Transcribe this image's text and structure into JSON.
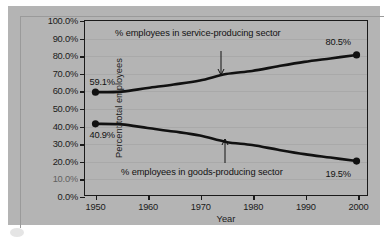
{
  "chart_data": {
    "type": "line",
    "title": "",
    "xlabel": "Year",
    "ylabel": "Percent total employees",
    "xlim": [
      1948,
      2002
    ],
    "ylim": [
      0,
      100
    ],
    "grid": true,
    "legend_position": "inline-annotations",
    "x_ticks": [
      "1950",
      "1960",
      "1970",
      "1980",
      "1990",
      "2000"
    ],
    "x_tick_values": [
      1950,
      1960,
      1970,
      1980,
      1990,
      2000
    ],
    "y_ticks": [
      "0.0%",
      "10.0%",
      "20.0%",
      "30.0%",
      "40.0%",
      "50.0%",
      "60.0%",
      "70.0%",
      "80.0%",
      "90.0%",
      "100.0%"
    ],
    "y_tick_values": [
      0,
      10,
      20,
      30,
      40,
      50,
      60,
      70,
      80,
      90,
      100
    ],
    "series": [
      {
        "name": "% employees in service-producing sector",
        "x": [
          1950,
          1955,
          1960,
          1965,
          1970,
          1975,
          1980,
          1985,
          1990,
          1995,
          2000
        ],
        "values": [
          59.1,
          59.4,
          61.5,
          63.5,
          65.8,
          69.5,
          71.3,
          74.0,
          76.5,
          78.5,
          80.5
        ],
        "start_label": "59.1%",
        "end_label": "80.5%"
      },
      {
        "name": "% employees in goods-producing sector",
        "x": [
          1950,
          1955,
          1960,
          1965,
          1970,
          1975,
          1980,
          1985,
          1990,
          1995,
          2000
        ],
        "values": [
          40.9,
          40.6,
          38.5,
          36.5,
          34.2,
          30.5,
          28.7,
          26.0,
          23.5,
          21.5,
          19.5
        ],
        "start_label": "40.9%",
        "end_label": "19.5%"
      }
    ],
    "annotations": [
      {
        "text": "% employees in service-producing sector",
        "points_to_series": "service",
        "arrow": "down"
      },
      {
        "text": "% employees in goods-producing sector",
        "points_to_series": "goods",
        "arrow": "up"
      }
    ],
    "point_labels": [
      {
        "text": "59.1%",
        "x": 1950,
        "y": 59.1,
        "position": "above-right"
      },
      {
        "text": "80.5%",
        "x": 2000,
        "y": 80.5,
        "position": "above-left"
      },
      {
        "text": "40.9%",
        "x": 1950,
        "y": 40.9,
        "position": "below-right"
      },
      {
        "text": "19.5%",
        "x": 2000,
        "y": 19.5,
        "position": "below-left"
      }
    ],
    "colors": {
      "line": "#111111",
      "marker": "#111111",
      "plot_background": "#b4b4b4",
      "grid": "#a0a0a0",
      "axis": "#1a1a1a",
      "text": "#121212"
    }
  }
}
